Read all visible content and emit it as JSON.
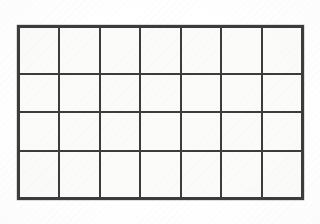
{
  "document": {
    "type": "blank-grid-table",
    "description": "Empty hand-drawn/printed grid of rectangular cells on white paper",
    "background_color": "#ffffff",
    "paper_color": "#fbfbfa"
  },
  "grid": {
    "columns": 7,
    "rows": 4,
    "line_color": "#3c3c3c",
    "line_width_px": 2,
    "outer_border_width_px": 3,
    "cell_fill_color": "#fbfbfa",
    "bounds": {
      "left_px": 17,
      "top_px": 25,
      "width_px": 287,
      "height_px": 175
    },
    "cell_width_px": 41,
    "cell_height_px": 43.75,
    "column_line_x_px": [
      17,
      58,
      99,
      140,
      181,
      222,
      263,
      304
    ],
    "row_line_y_px": [
      25,
      69,
      113,
      157,
      200
    ],
    "has_header_row": false,
    "has_header_column": false,
    "cells": [
      [
        "",
        "",
        "",
        "",
        "",
        "",
        ""
      ],
      [
        "",
        "",
        "",
        "",
        "",
        "",
        ""
      ],
      [
        "",
        "",
        "",
        "",
        "",
        "",
        ""
      ],
      [
        "",
        "",
        "",
        "",
        "",
        "",
        ""
      ]
    ]
  }
}
